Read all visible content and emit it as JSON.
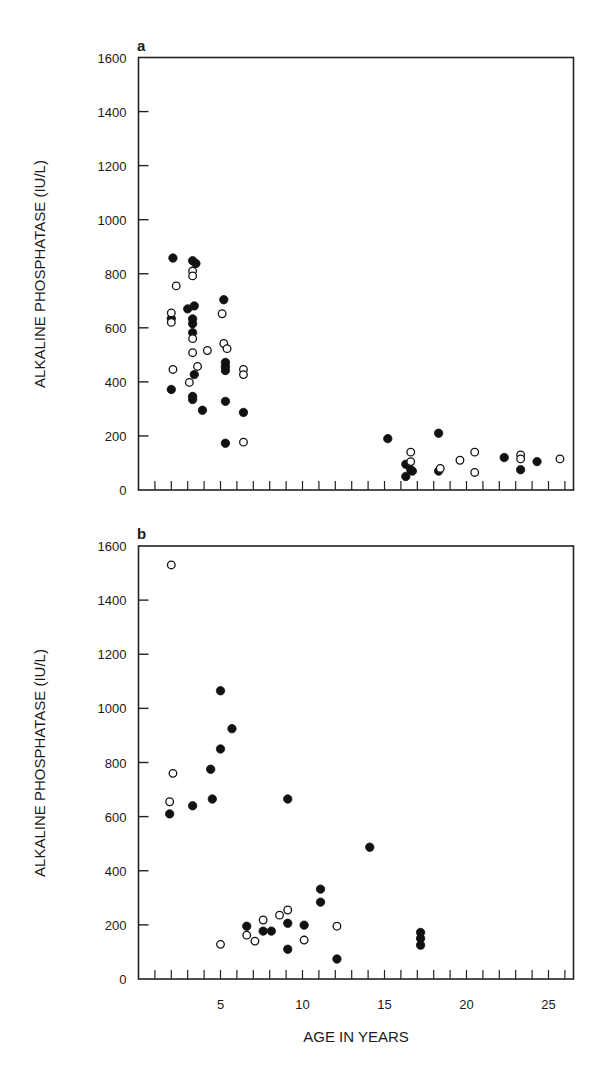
{
  "chart_data": [
    {
      "type": "scatter",
      "panel": "a",
      "title": "",
      "xlabel": "",
      "ylabel": "ALKALINE PHOSPHATASE (IU/L)",
      "xlim": [
        0,
        26.5
      ],
      "ylim": [
        0,
        1600
      ],
      "yticks": [
        0,
        200,
        400,
        600,
        800,
        1000,
        1200,
        1400,
        1600
      ],
      "xticks_minor_every": 1,
      "xtick_labels": [],
      "grid": false,
      "legend": null,
      "series": [
        {
          "name": "filled",
          "marker": "filled-circle",
          "points": [
            [
              2.1,
              858
            ],
            [
              3.3,
              848
            ],
            [
              3.5,
              838
            ],
            [
              5.2,
              704
            ],
            [
              2.0,
              634
            ],
            [
              3.0,
              670
            ],
            [
              3.4,
              681
            ],
            [
              3.3,
              633
            ],
            [
              3.3,
              615
            ],
            [
              3.3,
              582
            ],
            [
              5.3,
              472
            ],
            [
              5.3,
              457
            ],
            [
              5.3,
              442
            ],
            [
              3.4,
              427
            ],
            [
              2.0,
              372
            ],
            [
              3.3,
              346
            ],
            [
              3.3,
              335
            ],
            [
              5.3,
              328
            ],
            [
              3.9,
              295
            ],
            [
              6.4,
              287
            ],
            [
              5.3,
              173
            ],
            [
              15.2,
              190
            ],
            [
              18.3,
              210
            ],
            [
              16.3,
              95
            ],
            [
              16.6,
              75
            ],
            [
              16.7,
              70
            ],
            [
              16.3,
              50
            ],
            [
              18.3,
              70
            ],
            [
              22.3,
              120
            ],
            [
              23.3,
              75
            ],
            [
              24.3,
              105
            ]
          ]
        },
        {
          "name": "open",
          "marker": "open-circle",
          "points": [
            [
              3.3,
              810
            ],
            [
              3.3,
              792
            ],
            [
              2.3,
              755
            ],
            [
              2.0,
              655
            ],
            [
              2.0,
              620
            ],
            [
              5.1,
              652
            ],
            [
              3.3,
              560
            ],
            [
              3.3,
              508
            ],
            [
              4.2,
              516
            ],
            [
              5.2,
              542
            ],
            [
              5.4,
              523
            ],
            [
              2.1,
              446
            ],
            [
              3.6,
              457
            ],
            [
              3.1,
              398
            ],
            [
              6.4,
              446
            ],
            [
              6.4,
              427
            ],
            [
              6.4,
              177
            ],
            [
              16.6,
              140
            ],
            [
              16.6,
              105
            ],
            [
              18.4,
              80
            ],
            [
              19.6,
              110
            ],
            [
              20.5,
              140
            ],
            [
              20.5,
              65
            ],
            [
              23.3,
              130
            ],
            [
              23.3,
              115
            ],
            [
              25.7,
              115
            ]
          ]
        }
      ]
    },
    {
      "type": "scatter",
      "panel": "b",
      "title": "",
      "xlabel": "AGE IN YEARS",
      "ylabel": "ALKALINE PHOSPHATASE (IU/L)",
      "xlim": [
        0,
        26.5
      ],
      "ylim": [
        0,
        1600
      ],
      "yticks": [
        0,
        200,
        400,
        600,
        800,
        1000,
        1200,
        1400,
        1600
      ],
      "xticks_minor_every": 1,
      "xtick_labels": [
        5,
        10,
        15,
        20,
        25
      ],
      "grid": false,
      "legend": null,
      "series": [
        {
          "name": "filled",
          "marker": "filled-circle",
          "points": [
            [
              5.0,
              1065
            ],
            [
              5.7,
              925
            ],
            [
              5.0,
              850
            ],
            [
              4.4,
              775
            ],
            [
              4.5,
              665
            ],
            [
              3.3,
              640
            ],
            [
              1.9,
              610
            ],
            [
              9.1,
              665
            ],
            [
              14.1,
              487
            ],
            [
              11.1,
              332
            ],
            [
              11.1,
              284
            ],
            [
              6.6,
              195
            ],
            [
              7.6,
              177
            ],
            [
              8.1,
              177
            ],
            [
              9.1,
              206
            ],
            [
              10.1,
              199
            ],
            [
              9.1,
              110
            ],
            [
              12.1,
              74
            ],
            [
              17.2,
              172
            ],
            [
              17.2,
              150
            ],
            [
              17.2,
              125
            ]
          ]
        },
        {
          "name": "open",
          "marker": "open-circle",
          "points": [
            [
              2.0,
              1530
            ],
            [
              2.1,
              760
            ],
            [
              1.9,
              655
            ],
            [
              5.0,
              128
            ],
            [
              6.6,
              162
            ],
            [
              7.1,
              140
            ],
            [
              7.6,
              218
            ],
            [
              8.6,
              236
            ],
            [
              9.1,
              255
            ],
            [
              10.1,
              144
            ],
            [
              12.1,
              195
            ]
          ]
        }
      ]
    }
  ],
  "panels": {
    "a": {
      "letter": "a",
      "ylabel": "ALKALINE PHOSPHATASE (IU/L)"
    },
    "b": {
      "letter": "b",
      "ylabel": "ALKALINE PHOSPHATASE (IU/L)",
      "xlabel": "AGE IN YEARS"
    }
  }
}
